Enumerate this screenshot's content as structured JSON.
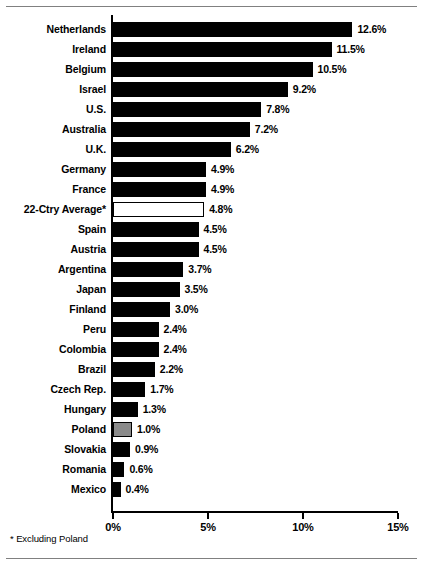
{
  "footnote": "* Excluding Poland",
  "colors": {
    "bar_default": "#000000",
    "bar_highlight": "#8a8a8a",
    "bar_average": "#ffffff",
    "axis": "#000000",
    "rule": "#808080"
  },
  "chart_data": {
    "type": "bar",
    "orientation": "horizontal",
    "title": "",
    "subtitle": "",
    "xlabel": "",
    "ylabel": "",
    "xlim": [
      0,
      15
    ],
    "grid": false,
    "legend": null,
    "value_suffix": "%",
    "xticks": [
      {
        "value": 0,
        "label": "0%"
      },
      {
        "value": 5,
        "label": "5%"
      },
      {
        "value": 10,
        "label": "10%"
      },
      {
        "value": 15,
        "label": "15%"
      }
    ],
    "categories": [
      "Netherlands",
      "Ireland",
      "Belgium",
      "Israel",
      "U.S.",
      "Australia",
      "U.K.",
      "Germany",
      "France",
      "22-Ctry Average*",
      "Spain",
      "Austria",
      "Argentina",
      "Japan",
      "Finland",
      "Peru",
      "Colombia",
      "Brazil",
      "Czech Rep.",
      "Hungary",
      "Poland",
      "Slovakia",
      "Romania",
      "Mexico"
    ],
    "values": [
      12.6,
      11.5,
      10.5,
      9.2,
      7.8,
      7.2,
      6.2,
      4.9,
      4.9,
      4.8,
      4.5,
      4.5,
      3.7,
      3.5,
      3.0,
      2.4,
      2.4,
      2.2,
      1.7,
      1.3,
      1.0,
      0.9,
      0.6,
      0.4
    ],
    "data_labels": [
      "12.6%",
      "11.5%",
      "10.5%",
      "9.2%",
      "7.8%",
      "7.2%",
      "6.2%",
      "4.9%",
      "4.9%",
      "4.8%",
      "4.5%",
      "4.5%",
      "3.7%",
      "3.5%",
      "3.0%",
      "2.4%",
      "2.4%",
      "2.2%",
      "1.7%",
      "1.3%",
      "1.0%",
      "0.9%",
      "0.6%",
      "0.4%"
    ],
    "bar_styles": [
      "solid",
      "solid",
      "solid",
      "solid",
      "solid",
      "solid",
      "solid",
      "solid",
      "solid",
      "hollow",
      "solid",
      "solid",
      "solid",
      "solid",
      "solid",
      "solid",
      "solid",
      "solid",
      "solid",
      "solid",
      "gray",
      "solid",
      "solid",
      "solid"
    ]
  }
}
